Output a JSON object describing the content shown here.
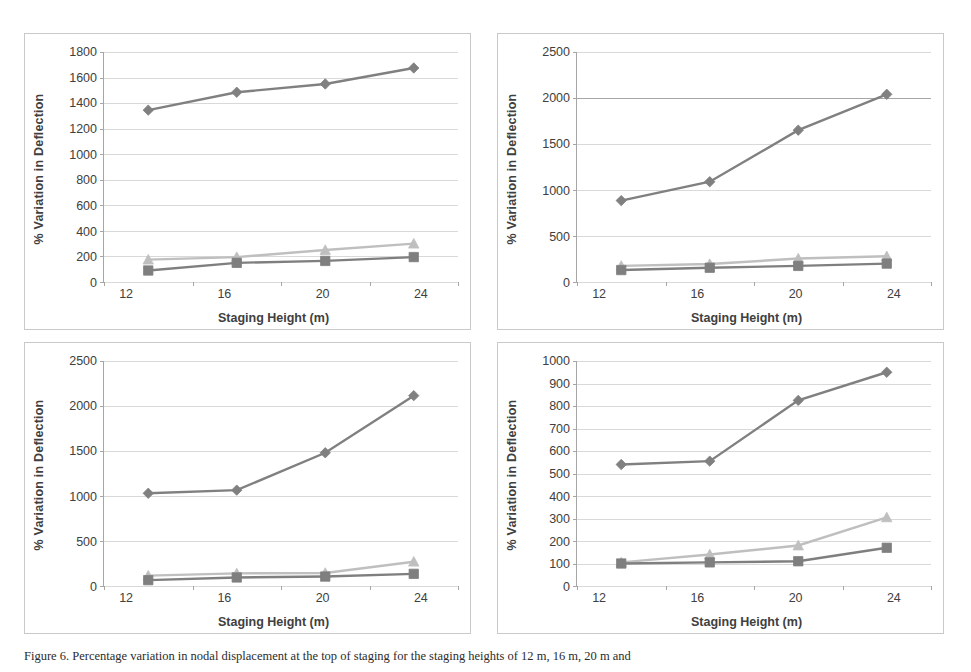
{
  "figure": {
    "caption": "Figure 6. Percentage variation in nodal displacement at the top of staging for the staging heights of 12 m, 16 m, 20 m and",
    "axis_title_x": "Staging Height (m)",
    "axis_title_y": "% Variation  in Deflection",
    "colors": {
      "series_diamond": "#808080",
      "series_square": "#7f7f7f",
      "series_triangle": "#bfbfbf",
      "gridline": "#d9d9d9",
      "axis": "#a6a6a6",
      "frame": "#c9c9c9",
      "text": "#404040"
    }
  },
  "chart_data": [
    {
      "type": "line",
      "panel": "top-left",
      "title": "",
      "xlabel": "Staging Height (m)",
      "ylabel": "% Variation  in Deflection",
      "categories": [
        "12",
        "16",
        "20",
        "24"
      ],
      "x": [
        12,
        16,
        20,
        24
      ],
      "ylim": [
        0,
        1800
      ],
      "yticks": [
        0,
        200,
        400,
        600,
        800,
        1000,
        1200,
        1400,
        1600,
        1800
      ],
      "grid": true,
      "legend": "none",
      "series": [
        {
          "name": "series-1",
          "marker": "diamond",
          "color": "#808080",
          "line": "#808080",
          "values": [
            1345,
            1485,
            1550,
            1675
          ]
        },
        {
          "name": "series-2",
          "marker": "triangle",
          "color": "#bfbfbf",
          "line": "#bfbfbf",
          "values": [
            175,
            195,
            250,
            300
          ]
        },
        {
          "name": "series-3",
          "marker": "square",
          "color": "#7f7f7f",
          "line": "#7f7f7f",
          "values": [
            90,
            150,
            165,
            195
          ]
        }
      ]
    },
    {
      "type": "line",
      "panel": "top-right",
      "title": "",
      "xlabel": "Staging Height (m)",
      "ylabel": "% Variation  in Deflection",
      "categories": [
        "12",
        "16",
        "20",
        "24"
      ],
      "x": [
        12,
        16,
        20,
        24
      ],
      "ylim": [
        0,
        2500
      ],
      "yticks": [
        0,
        500,
        1000,
        1500,
        2000,
        2500
      ],
      "grid": true,
      "legend": "none",
      "series": [
        {
          "name": "series-1",
          "marker": "diamond",
          "color": "#808080",
          "line": "#808080",
          "values": [
            885,
            1090,
            1650,
            2040
          ]
        },
        {
          "name": "series-2",
          "marker": "triangle",
          "color": "#bfbfbf",
          "line": "#bfbfbf",
          "values": [
            175,
            195,
            255,
            280
          ]
        },
        {
          "name": "series-3",
          "marker": "square",
          "color": "#7f7f7f",
          "line": "#7f7f7f",
          "values": [
            130,
            155,
            175,
            200
          ]
        }
      ]
    },
    {
      "type": "line",
      "panel": "bottom-left",
      "title": "",
      "xlabel": "Staging Height (m)",
      "ylabel": "% Variation  in Deflection",
      "categories": [
        "12",
        "16",
        "20",
        "24"
      ],
      "x": [
        12,
        16,
        20,
        24
      ],
      "ylim": [
        0,
        2500
      ],
      "yticks": [
        0,
        500,
        1000,
        1500,
        2000,
        2500
      ],
      "grid": true,
      "legend": "none",
      "series": [
        {
          "name": "series-1",
          "marker": "diamond",
          "color": "#808080",
          "line": "#808080",
          "values": [
            1030,
            1065,
            1480,
            2115
          ]
        },
        {
          "name": "series-2",
          "marker": "triangle",
          "color": "#bfbfbf",
          "line": "#bfbfbf",
          "values": [
            115,
            140,
            145,
            270
          ]
        },
        {
          "name": "series-3",
          "marker": "square",
          "color": "#7f7f7f",
          "line": "#7f7f7f",
          "values": [
            65,
            95,
            105,
            135
          ]
        }
      ]
    },
    {
      "type": "line",
      "panel": "bottom-right",
      "title": "",
      "xlabel": "Staging Height (m)",
      "ylabel": "% Variation  in Deflection",
      "categories": [
        "12",
        "16",
        "20",
        "24"
      ],
      "x": [
        12,
        16,
        20,
        24
      ],
      "ylim": [
        0,
        1000
      ],
      "yticks": [
        0,
        100,
        200,
        300,
        400,
        500,
        600,
        700,
        800,
        900,
        1000
      ],
      "grid": true,
      "legend": "none",
      "series": [
        {
          "name": "series-1",
          "marker": "diamond",
          "color": "#808080",
          "line": "#808080",
          "values": [
            540,
            555,
            825,
            950
          ]
        },
        {
          "name": "series-2",
          "marker": "triangle",
          "color": "#bfbfbf",
          "line": "#bfbfbf",
          "values": [
            105,
            140,
            180,
            305
          ]
        },
        {
          "name": "series-3",
          "marker": "square",
          "color": "#7f7f7f",
          "line": "#7f7f7f",
          "values": [
            100,
            105,
            110,
            170
          ]
        }
      ]
    }
  ]
}
